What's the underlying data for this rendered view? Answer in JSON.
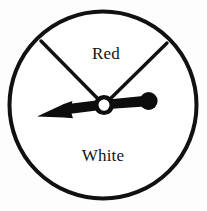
{
  "figure": {
    "name": "probability-spinner",
    "background_color": "#fdfdfd",
    "outline_color": "#111111",
    "needle_color": "#0d0d0d",
    "label_color": "#131313",
    "circle": {
      "center_x": 103,
      "center_y": 105,
      "radius": 94,
      "stroke_width": 4
    },
    "hub": {
      "center_x": 104,
      "center_y": 105,
      "outer_radius": 10,
      "inner_radius": 5.6,
      "ring_width": 4.4
    },
    "sectors": [
      {
        "id": "sector-red",
        "label": "Red",
        "label_x": 106,
        "label_y": 59,
        "start_angle_deg": -141,
        "end_angle_deg": -39,
        "sweep_deg": 102
      },
      {
        "id": "sector-white",
        "label": "White",
        "label_x": 103,
        "label_y": 161,
        "start_angle_deg": -39,
        "end_angle_deg": 219,
        "sweep_deg": 258
      }
    ],
    "dividers": [
      {
        "id": "divider-left",
        "from_x": 104,
        "from_y": 105,
        "to_x": 41,
        "to_y": 41,
        "stroke_width": 3.4
      },
      {
        "id": "divider-right",
        "from_x": 104,
        "from_y": 105,
        "to_x": 167,
        "to_y": 43,
        "stroke_width": 3.4
      }
    ],
    "needle": {
      "pointer_tip_x": 37,
      "pointer_tip_y": 116,
      "counterweight_x": 149,
      "counterweight_y": 101,
      "counterweight_radius": 9,
      "pointing_angle_deg": 186,
      "pointing_at_label": "White"
    }
  }
}
